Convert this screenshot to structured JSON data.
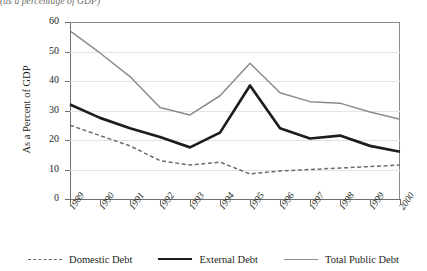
{
  "figure": {
    "title_cropped": "(as a percentage of GDP)",
    "y_axis_title": "As a Percent of GDP"
  },
  "legend": {
    "items": [
      {
        "label": "Domestic Debt",
        "style": "dashed",
        "color": "#6d6c6a"
      },
      {
        "label": "External Debt",
        "style": "solid-thick",
        "color": "#1d1d1b"
      },
      {
        "label": "Total Public Debt",
        "style": "solid-thin",
        "color": "#8d8c8a"
      }
    ]
  },
  "axes": {
    "y_ticks": [
      "60",
      "50",
      "40",
      "30",
      "20",
      "10",
      "0"
    ],
    "x_ticks": [
      "1989",
      "1990",
      "1991",
      "1992",
      "1993",
      "1994",
      "1995",
      "1996",
      "1997",
      "1998",
      "1999",
      "2000"
    ]
  },
  "chart_data": {
    "type": "line",
    "title": "(as a percentage of GDP)",
    "xlabel": "",
    "ylabel": "As a Percent of GDP",
    "x": [
      1989,
      1990,
      1991,
      1992,
      1993,
      1994,
      1995,
      1996,
      1997,
      1998,
      1999,
      2000
    ],
    "categories": [
      "1989",
      "1990",
      "1991",
      "1992",
      "1993",
      "1994",
      "1995",
      "1996",
      "1997",
      "1998",
      "1999",
      "2000"
    ],
    "ylim": [
      0,
      60
    ],
    "ytick_step": 10,
    "grid": true,
    "legend_position": "bottom",
    "series": [
      {
        "name": "Domestic Debt",
        "style": "dashed",
        "color": "#6d6c6a",
        "values": [
          25,
          21.5,
          18,
          13,
          11.5,
          12.5,
          8.5,
          9.5,
          10,
          10.5,
          11,
          11.5
        ]
      },
      {
        "name": "External Debt",
        "style": "solid-thick",
        "color": "#1d1d1b",
        "values": [
          32,
          27.5,
          24,
          21,
          17.5,
          22.5,
          38.5,
          24,
          20.5,
          21.5,
          18,
          16
        ]
      },
      {
        "name": "Total Public Debt",
        "style": "solid-thin",
        "color": "#8d8c8a",
        "values": [
          57,
          49.5,
          41.5,
          31,
          28.5,
          35,
          46,
          36,
          33,
          32.5,
          29.5,
          27
        ]
      }
    ]
  }
}
